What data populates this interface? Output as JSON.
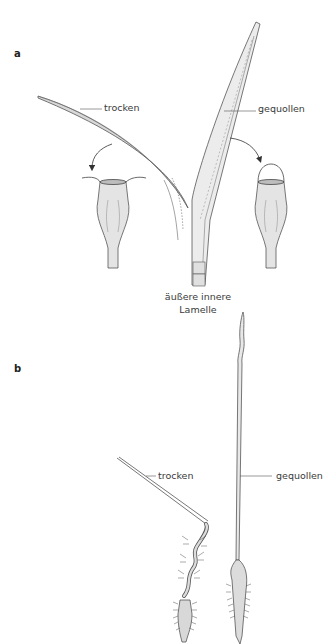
{
  "figure": {
    "panels": [
      {
        "id": "a",
        "label": "a",
        "labels": {
          "dry": "trocken",
          "swollen": "gequollen",
          "lamella_line1": "äußere innere",
          "lamella_line2": "Lamelle"
        }
      },
      {
        "id": "b",
        "label": "b",
        "labels": {
          "dry": "trocken",
          "swollen": "gequollen"
        }
      }
    ],
    "colors": {
      "line": "#555555",
      "fill_light": "#e6e6e6",
      "fill_mid": "#d0d0d0",
      "text": "#3a3a3a"
    }
  }
}
